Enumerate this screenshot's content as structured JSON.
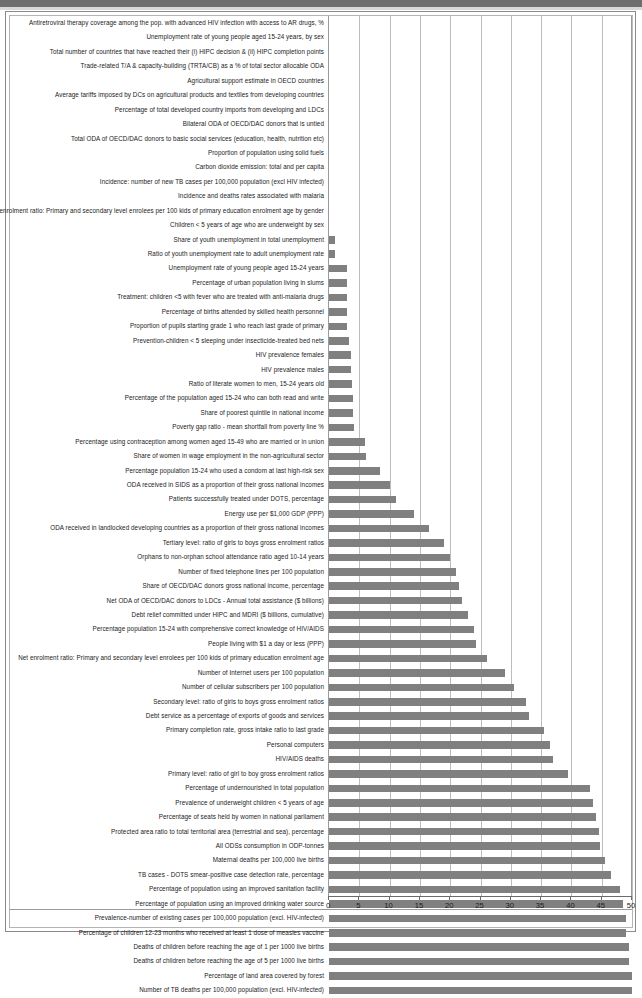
{
  "chart_data": {
    "type": "bar",
    "orientation": "horizontal",
    "title": "",
    "xlabel": "",
    "ylabel": "",
    "xlim": [
      0,
      50
    ],
    "xticks": [
      0,
      5,
      10,
      15,
      20,
      25,
      30,
      35,
      40,
      45,
      50
    ],
    "grid": true,
    "legend": "none",
    "bar_color": "#808080",
    "categories": [
      "Antiretroviral therapy coverage among the pop. with advanced HIV infection with access to AR drugs, %",
      "Unemployment rate of young people aged 15-24 years, by sex",
      "Total number of countries that have reached their (i) HIPC decision & (ii) HIPC completion points",
      "Trade-related T/A & capacity-building (TRTA/CB) as a % of total sector allocable ODA",
      "Agricultural support estimate in OECD countries",
      "Average tariffs imposed by DCs on agricultural products and textiles from developing countries",
      "Percentage of total developed country imports from developing and LDCs",
      "Bilateral ODA of OECD/DAC donors that is untied",
      "Total ODA of OECD/DAC donors to basic social services (education, health, nutrition etc)",
      "Proportion of population using solid fuels",
      "Carbon dioxide emission: total and per capita",
      "Incidence: number of new TB cases per 100,000 population (excl HIV infected)",
      "Incidence and deaths rates associated with malaria",
      "Net enrolment ratio: Primary and secondary level enrolees per 100 kids of primary education enrolment age by gender",
      "Children < 5 years of age who are underweight by sex",
      "Share of youth unemployment in total unemployment",
      "Ratio of youth unemployment rate to adult unemployment rate",
      "Unemployment rate of young people aged 15-24 years",
      "Percentage of urban population living in slums",
      "Treatment: children <5 with fever who are treated with anti-malaria drugs",
      "Percentage of births attended by skilled health personnel",
      "Proportion of pupils starting grade 1 who reach last grade of primary",
      "Prevention-children < 5 sleeping under insecticide-treated bed nets",
      "HIV prevalence females",
      "HIV prevalence males",
      "Ratio of literate women to men, 15-24 years old",
      "Percentage of the population aged 15-24 who can both read and write",
      "Share of poorest quintile in national income",
      "Poverty gap ratio - mean shortfall from poverty line %",
      "Percentage using contraception among women aged 15-49 who are married or in union",
      "Share of women in wage employment in the non-agricultural sector",
      "Percentage population 15-24 who used a condom at last high-risk sex",
      "ODA received in SIDS as a proportion of their gross national incomes",
      "Patients successfully treated under DOTS, percentage",
      "Energy use per $1,000 GDP (PPP)",
      "ODA received in landlocked developing countries as a proportion of their gross national incomes",
      "Tertiary level: ratio of girls to boys gross enrolment ratios",
      "Orphans to non-orphan school attendance ratio aged 10-14 years",
      "Number of fixed telephone lines per 100 population",
      "Share of OECD/DAC donors gross national income, percentage",
      "Net ODA of OECD/DAC donors to LDCs - Annual total assistance ($ billions)",
      "Debt relief committed under HIPC and MDRI ($ billions, cumulative)",
      "Percentage population 15-24 with comprehensive correct knowledge of HIV/AIDS",
      "People living with $1 a day or less (PPP)",
      "Net enrolment ratio: Primary and secondary level enrolees per 100 kids of primary education enrolment age",
      "Number of Internet users per 100 population",
      "Number of cellular subscribers per 100 population",
      "Secondary level: ratio of girls to boys gross enrolment ratios",
      "Debt service as a percentage of exports of goods and services",
      "Primary completion rate, gross intake ratio to last grade",
      "Personal computers",
      "HIV/AIDS deaths",
      "Primary level: ratio of girl to boy gross enrolment ratios",
      "Percentage of undernourished in total population",
      "Prevalence of underweight children < 5 years of age",
      "Percentage of seats held by women in national parliament",
      "Protected area ratio to total territorial area (terrestrial and sea), percentage",
      "All ODSs consumption in ODP-tonnes",
      "Maternal deaths per 100,000 live births",
      "TB cases - DOTS smear-positive case detection rate, percentage",
      "Percentage of population using an improved sanitation facility",
      "Percentage of population using an improved drinking water source",
      "Prevalence-number of existing cases per 100,000 population (excl. HIV-infected)",
      "Percentage of children 12-23 months who received at least 1 dose of measles vaccine",
      "Deaths of children before reaching the age of 1 per 1000 live births",
      "Deaths of children before reaching the age of 5 per 1000 live births",
      "Percentage of land area covered by forest",
      "Number of TB deaths per 100,000 population (excl. HIV-infected)"
    ],
    "values": [
      0,
      0,
      0,
      0,
      0,
      0,
      0,
      0,
      0,
      0,
      0,
      0,
      0,
      0,
      0,
      1,
      1,
      3,
      3,
      3,
      3,
      3,
      3.3,
      3.6,
      3.6,
      3.8,
      3.9,
      4,
      4.2,
      6,
      6.1,
      8.4,
      10,
      11,
      14,
      16.5,
      19,
      20,
      21,
      21.5,
      22,
      23,
      24,
      24.2,
      26,
      29,
      30.5,
      32.5,
      33,
      35.5,
      36.5,
      37,
      39.5,
      43,
      43.5,
      44,
      44.5,
      44.8,
      45.5,
      46.5,
      48,
      48.5,
      49,
      49,
      49.5,
      49.5,
      50,
      50
    ]
  }
}
